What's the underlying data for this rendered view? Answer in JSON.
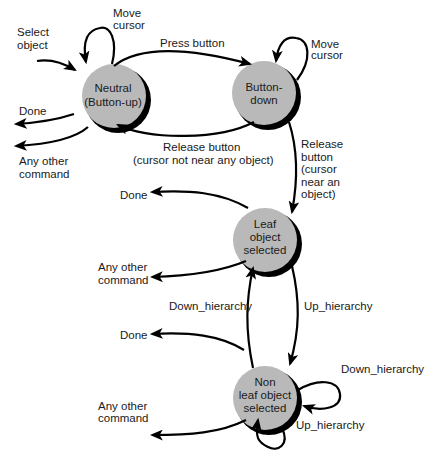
{
  "diagram": {
    "type": "state-transition",
    "colors": {
      "node_fill": "#b9b9b9",
      "node_shadow": "#000000",
      "edge": "#000000",
      "text": "#1a1a1a",
      "background": "#ffffff"
    },
    "nodes": [
      {
        "id": "neutral",
        "lines": [
          "Neutral",
          "(Button-up)"
        ]
      },
      {
        "id": "button_down",
        "lines": [
          "Button-",
          "down"
        ]
      },
      {
        "id": "leaf",
        "lines": [
          "Leaf",
          "object",
          "selected"
        ]
      },
      {
        "id": "nonleaf",
        "lines": [
          "Non",
          "leaf object",
          "selected"
        ]
      }
    ],
    "labels": {
      "select_object": [
        "Select",
        "object"
      ],
      "move_cursor_neutral": [
        "Move",
        "cursor"
      ],
      "press_button": "Press button",
      "move_cursor_bd": [
        "Move",
        "cursor"
      ],
      "done_neutral": "Done",
      "any_other_neutral": [
        "Any other",
        "command"
      ],
      "release_not_near": [
        "Release button",
        "(cursor not near any object)"
      ],
      "release_near": [
        "Release",
        "button",
        "(cursor",
        "near an",
        "object)"
      ],
      "done_leaf": "Done",
      "any_other_leaf": [
        "Any other",
        "command"
      ],
      "down_hierarchy_leaf": "Down_hierarchy",
      "up_hierarchy_leaf": "Up_hierarchy",
      "done_nonleaf": "Done",
      "any_other_nonleaf": [
        "Any other",
        "command"
      ],
      "down_hierarchy_self": "Down_hierarchy",
      "up_hierarchy_self": "Up_hierarchy"
    }
  }
}
